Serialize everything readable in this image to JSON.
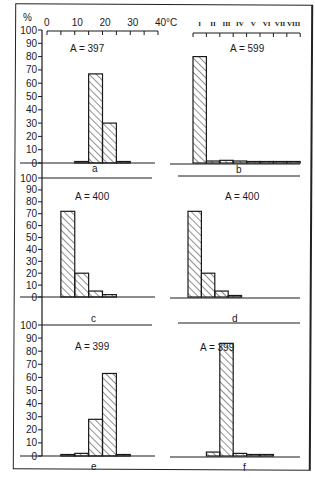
{
  "header": {
    "percent_label": "%",
    "temp_axis": {
      "ticks": [
        "0",
        "10",
        "20",
        "30",
        "40°C"
      ],
      "unit": "°C"
    },
    "roman_axis": {
      "ticks": [
        "I",
        "II",
        "III",
        "IV",
        "V",
        "VI",
        "VII",
        "VIII"
      ]
    }
  },
  "y_axis": {
    "ticks": [
      "100",
      "90",
      "80",
      "70",
      "60",
      "50",
      "40",
      "30",
      "20",
      "10",
      "0"
    ]
  },
  "panels": [
    {
      "id": "a",
      "label": "a",
      "annotation": "A = 397",
      "axis": "temperature"
    },
    {
      "id": "b",
      "label": "b",
      "annotation": "A = 599",
      "axis": "roman"
    },
    {
      "id": "c",
      "label": "c",
      "annotation": "A = 400",
      "axis": "temperature"
    },
    {
      "id": "d",
      "label": "d",
      "annotation": "A = 400",
      "axis": "roman"
    },
    {
      "id": "e",
      "label": "e",
      "annotation": "A = 399",
      "axis": "temperature"
    },
    {
      "id": "f",
      "label": "f",
      "annotation": "A = 399",
      "axis": "roman"
    }
  ],
  "chart_data": [
    {
      "type": "bar",
      "title": "a",
      "annotation": "A = 397",
      "xlabel": "Temperature (°C)",
      "ylabel": "%",
      "ylim": [
        0,
        100
      ],
      "categories": [
        "10-15",
        "15-20",
        "20-25",
        "25-30"
      ],
      "values": [
        1,
        67,
        30,
        1
      ]
    },
    {
      "type": "bar",
      "title": "b",
      "annotation": "A = 599",
      "xlabel": "Class",
      "ylabel": "%",
      "ylim": [
        0,
        100
      ],
      "categories": [
        "I",
        "II",
        "III",
        "IV",
        "V",
        "VI",
        "VII",
        "VIII"
      ],
      "values": [
        80,
        1.5,
        2,
        1.5,
        0.5,
        0,
        0.5,
        1
      ]
    },
    {
      "type": "bar",
      "title": "c",
      "annotation": "A = 400",
      "xlabel": "Temperature (°C)",
      "ylabel": "%",
      "ylim": [
        0,
        100
      ],
      "categories": [
        "5-10",
        "10-15",
        "15-20",
        "20-25"
      ],
      "values": [
        72,
        20,
        5,
        2
      ]
    },
    {
      "type": "bar",
      "title": "d",
      "annotation": "A = 400",
      "xlabel": "Class",
      "ylabel": "%",
      "ylim": [
        0,
        100
      ],
      "categories": [
        "I",
        "II",
        "III",
        "IV"
      ],
      "values": [
        72,
        20,
        5,
        1
      ]
    },
    {
      "type": "bar",
      "title": "e",
      "annotation": "A = 399",
      "xlabel": "Temperature (°C)",
      "ylabel": "%",
      "ylim": [
        0,
        100
      ],
      "categories": [
        "5-10",
        "10-15",
        "15-20",
        "20-25",
        "25-30"
      ],
      "values": [
        1,
        2,
        28,
        63,
        1
      ]
    },
    {
      "type": "bar",
      "title": "f",
      "annotation": "A = 399",
      "xlabel": "Class",
      "ylabel": "%",
      "ylim": [
        0,
        100
      ],
      "categories": [
        "II",
        "III",
        "IV",
        "V",
        "VI"
      ],
      "values": [
        3,
        86,
        2,
        1,
        0.5
      ]
    }
  ]
}
